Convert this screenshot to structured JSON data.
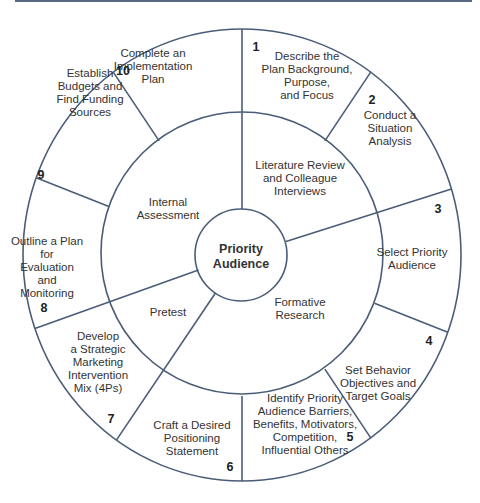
{
  "diagram": {
    "center": {
      "label_lines": [
        "Priority",
        "Audience"
      ]
    },
    "middle_ring": [
      {
        "id": "literature-review",
        "lines": [
          "Literature Review",
          "and Colleague",
          "Interviews"
        ]
      },
      {
        "id": "formative-research",
        "lines": [
          "Formative",
          "Research"
        ]
      },
      {
        "id": "pretest",
        "lines": [
          "Pretest"
        ]
      },
      {
        "id": "internal-assessment",
        "lines": [
          "Internal",
          "Assessment"
        ]
      }
    ],
    "steps": [
      {
        "number": "1",
        "lines": [
          "Describe the",
          "Plan Background,",
          "Purpose,",
          "and Focus"
        ]
      },
      {
        "number": "2",
        "lines": [
          "Conduct a",
          "Situation",
          "Analysis"
        ]
      },
      {
        "number": "3",
        "lines": [
          "Select Priority",
          "Audience"
        ]
      },
      {
        "number": "4",
        "lines": [
          "Set Behavior",
          "Objectives and",
          "Target Goals"
        ]
      },
      {
        "number": "5",
        "lines": [
          "Identify Priority",
          "Audience Barriers,",
          "Benefits, Motivators,",
          "Competition,",
          "Influential Others"
        ]
      },
      {
        "number": "6",
        "lines": [
          "Craft a Desired",
          "Positioning",
          "Statement"
        ]
      },
      {
        "number": "7",
        "lines": [
          "Develop",
          "a Strategic",
          "Marketing",
          "Intervention",
          "Mix (4Ps)"
        ]
      },
      {
        "number": "8",
        "lines": [
          "Outline a Plan",
          "for",
          "Evaluation",
          "and",
          "Monitoring"
        ]
      },
      {
        "number": "9",
        "lines": [
          "Establish",
          "Budgets and",
          "Find Funding",
          "Sources"
        ]
      },
      {
        "number": "10",
        "lines": [
          "Complete an",
          "Implementation",
          "Plan"
        ]
      }
    ],
    "colors": {
      "line": "#4a5d78",
      "text": "#333333",
      "strip": "#5a6a82"
    }
  }
}
